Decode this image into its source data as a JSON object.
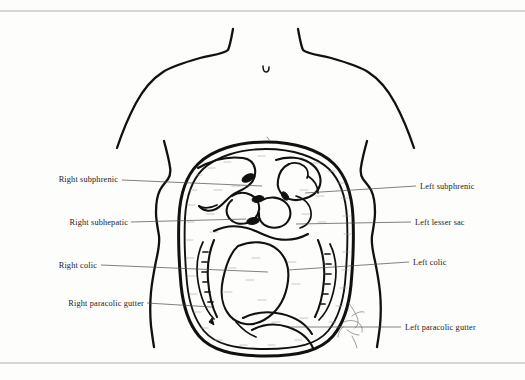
{
  "figure": {
    "style": "pen-and-ink line drawing, stippled peritoneal spaces, thin grey rules at top and bottom of the page"
  },
  "labels_left": [
    {
      "id": "right-subphrenic",
      "text": "Right subphrenic",
      "text_x": 118,
      "text_y": 182,
      "leader_x1": 122,
      "leader_y1": 180,
      "leader_x2": 262,
      "leader_y2": 186
    },
    {
      "id": "right-subhepatic",
      "text": "Right subhepatic",
      "text_x": 128,
      "text_y": 225,
      "leader_x1": 131,
      "leader_y1": 222,
      "leader_x2": 246,
      "leader_y2": 219
    },
    {
      "id": "right-colic",
      "text": "Right colic",
      "text_x": 97,
      "text_y": 268,
      "leader_x1": 101,
      "leader_y1": 265,
      "leader_x2": 268,
      "leader_y2": 272
    },
    {
      "id": "right-paracolic-gutter",
      "text": "Right paracolic gutter",
      "text_x": 144,
      "text_y": 306,
      "leader_x1": 147,
      "leader_y1": 303,
      "leader_x2": 212,
      "leader_y2": 307
    }
  ],
  "labels_right": [
    {
      "id": "left-subphrenic",
      "text": "Left subphrenic",
      "text_x": 420,
      "text_y": 189,
      "leader_x1": 416,
      "leader_y1": 186,
      "leader_x2": 305,
      "leader_y2": 193
    },
    {
      "id": "left-lesser-sac",
      "text": "Left lesser sac",
      "text_x": 415,
      "text_y": 225,
      "leader_x1": 411,
      "leader_y1": 222,
      "leader_x2": 296,
      "leader_y2": 224
    },
    {
      "id": "left-colic",
      "text": "Left colic",
      "text_x": 413,
      "text_y": 265,
      "leader_x1": 409,
      "leader_y1": 262,
      "leader_x2": 288,
      "leader_y2": 270
    },
    {
      "id": "left-paracolic-gutter",
      "text": "Left paracolic gutter",
      "text_x": 405,
      "text_y": 330,
      "leader_x1": 401,
      "leader_y1": 327,
      "leader_x2": 290,
      "leader_y2": 327
    }
  ],
  "anatomy": {
    "regions": [
      "right subphrenic space",
      "left subphrenic space",
      "right subhepatic space",
      "left lesser sac",
      "right colic compartment",
      "left colic compartment",
      "right paracolic gutter",
      "left paracolic gutter"
    ],
    "torso": "shoulders, neck base, sternal notch, costal margins, flanks",
    "signature": "artist initials, lower right of cavity"
  },
  "colors": {
    "ink": "#111111",
    "leader": "#4a4a4a",
    "rule": "#9a9a9a",
    "paper": "#fdfdfc",
    "stipple": "#9d9d9d"
  }
}
